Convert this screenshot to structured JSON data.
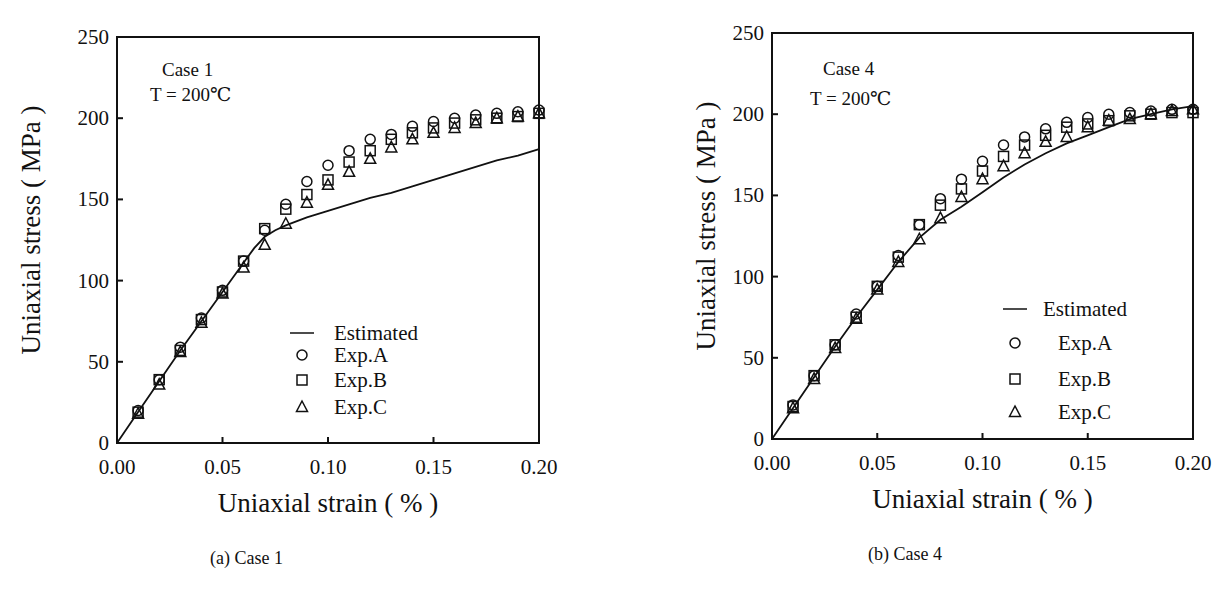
{
  "chart_data": [
    {
      "type": "scatter",
      "panel": "a",
      "caption": "(a) Case 1",
      "annotations": [
        "Case 1",
        "T = 200℃"
      ],
      "xlabel": "Uniaxial strain ( % )",
      "ylabel": "Uniaxial stress ( MPa )",
      "xlim": [
        0.0,
        0.2
      ],
      "ylim": [
        0,
        250
      ],
      "xticks": [
        "0.00",
        "0.05",
        "0.10",
        "0.15",
        "0.20"
      ],
      "yticks": [
        "0",
        "50",
        "100",
        "150",
        "200",
        "250"
      ],
      "grid": false,
      "legend_position": "lower-center inside",
      "legend": [
        "Estimated",
        "Exp.A",
        "Exp.B",
        "Exp.C"
      ],
      "series": [
        {
          "name": "Estimated",
          "style": "line",
          "x": [
            0.0,
            0.01,
            0.02,
            0.03,
            0.04,
            0.05,
            0.06,
            0.065,
            0.07,
            0.075,
            0.08,
            0.09,
            0.1,
            0.11,
            0.12,
            0.13,
            0.14,
            0.15,
            0.16,
            0.17,
            0.18,
            0.19,
            0.2
          ],
          "y": [
            0,
            19,
            38,
            57,
            75,
            93,
            111,
            120,
            127,
            131,
            134,
            139,
            143,
            147,
            151,
            154,
            158,
            162,
            166,
            170,
            174,
            177,
            181
          ]
        },
        {
          "name": "Exp.A",
          "style": "circle",
          "x": [
            0.01,
            0.02,
            0.03,
            0.04,
            0.05,
            0.06,
            0.07,
            0.08,
            0.09,
            0.1,
            0.11,
            0.12,
            0.13,
            0.14,
            0.15,
            0.16,
            0.17,
            0.18,
            0.19,
            0.2
          ],
          "y": [
            20,
            39,
            59,
            77,
            94,
            112,
            131,
            147,
            161,
            171,
            180,
            187,
            190,
            195,
            198,
            200,
            202,
            203,
            204,
            205
          ]
        },
        {
          "name": "Exp.B",
          "style": "square",
          "x": [
            0.01,
            0.02,
            0.03,
            0.04,
            0.05,
            0.06,
            0.07,
            0.08,
            0.09,
            0.1,
            0.11,
            0.12,
            0.13,
            0.14,
            0.15,
            0.16,
            0.17,
            0.18,
            0.19,
            0.2
          ],
          "y": [
            19,
            39,
            57,
            76,
            93,
            112,
            132,
            144,
            153,
            162,
            173,
            180,
            187,
            191,
            194,
            197,
            199,
            200,
            201,
            203
          ]
        },
        {
          "name": "Exp.C",
          "style": "triangle",
          "x": [
            0.01,
            0.02,
            0.03,
            0.04,
            0.05,
            0.06,
            0.07,
            0.08,
            0.09,
            0.1,
            0.11,
            0.12,
            0.13,
            0.14,
            0.15,
            0.16,
            0.17,
            0.18,
            0.19,
            0.2
          ],
          "y": [
            18,
            36,
            56,
            74,
            92,
            108,
            122,
            135,
            148,
            159,
            167,
            175,
            182,
            187,
            191,
            194,
            197,
            200,
            201,
            203
          ]
        }
      ]
    },
    {
      "type": "scatter",
      "panel": "b",
      "caption": "(b) Case 4",
      "annotations": [
        "Case 4",
        "T = 200℃"
      ],
      "xlabel": "Uniaxial strain ( % )",
      "ylabel": "Uniaxial stress ( MPa )",
      "xlim": [
        0.0,
        0.2
      ],
      "ylim": [
        0,
        250
      ],
      "xticks": [
        "0.00",
        "0.05",
        "0.10",
        "0.15",
        "0.20"
      ],
      "yticks": [
        "0",
        "50",
        "100",
        "150",
        "200",
        "250"
      ],
      "grid": false,
      "legend_position": "lower-right inside",
      "legend": [
        "Estimated",
        "Exp.A",
        "Exp.B",
        "Exp.C"
      ],
      "series": [
        {
          "name": "Estimated",
          "style": "line",
          "x": [
            0.0,
            0.01,
            0.02,
            0.03,
            0.04,
            0.05,
            0.06,
            0.07,
            0.08,
            0.09,
            0.1,
            0.11,
            0.12,
            0.13,
            0.14,
            0.15,
            0.16,
            0.17,
            0.18,
            0.19,
            0.2
          ],
          "y": [
            0,
            19,
            38,
            57,
            75,
            92,
            109,
            124,
            135,
            143,
            152,
            161,
            169,
            176,
            182,
            187,
            192,
            197,
            200,
            203,
            205
          ]
        },
        {
          "name": "Exp.A",
          "style": "circle",
          "x": [
            0.01,
            0.02,
            0.03,
            0.04,
            0.05,
            0.06,
            0.07,
            0.08,
            0.09,
            0.1,
            0.11,
            0.12,
            0.13,
            0.14,
            0.15,
            0.16,
            0.17,
            0.18,
            0.19,
            0.2
          ],
          "y": [
            21,
            39,
            58,
            77,
            94,
            113,
            132,
            148,
            160,
            171,
            181,
            186,
            191,
            195,
            198,
            200,
            201,
            202,
            203,
            203
          ]
        },
        {
          "name": "Exp.B",
          "style": "square",
          "x": [
            0.01,
            0.02,
            0.03,
            0.04,
            0.05,
            0.06,
            0.07,
            0.08,
            0.09,
            0.1,
            0.11,
            0.12,
            0.13,
            0.14,
            0.15,
            0.16,
            0.17,
            0.18,
            0.19,
            0.2
          ],
          "y": [
            20,
            39,
            58,
            75,
            94,
            112,
            132,
            144,
            154,
            165,
            174,
            181,
            187,
            192,
            194,
            196,
            199,
            200,
            201,
            201
          ]
        },
        {
          "name": "Exp.C",
          "style": "triangle",
          "x": [
            0.01,
            0.02,
            0.03,
            0.04,
            0.05,
            0.06,
            0.07,
            0.08,
            0.09,
            0.1,
            0.11,
            0.12,
            0.13,
            0.14,
            0.15,
            0.16,
            0.17,
            0.18,
            0.19,
            0.2
          ],
          "y": [
            19,
            37,
            56,
            74,
            92,
            109,
            123,
            136,
            149,
            160,
            168,
            176,
            183,
            186,
            192,
            196,
            197,
            200,
            202,
            203
          ]
        }
      ]
    }
  ]
}
